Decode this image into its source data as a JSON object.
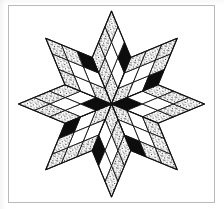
{
  "figure": {
    "kind": "eight-pointed-star-quilt-diagram",
    "border_label": "page-border"
  },
  "style": {
    "line_color": "#111111",
    "paper_color": "#ffffff",
    "solid_fill": "#0d0d0d",
    "stipple_fill": "#1a1a1a",
    "plain_fill": "#ffffff",
    "border_color": "#b9b9b9",
    "stroke_width": 0.9
  },
  "geometry": {
    "center_x": 103.5,
    "center_y": 99.0,
    "arm_length": 93.0,
    "half_width": 19.3,
    "arm_count": 8,
    "grid": 3,
    "arm_angles_deg": [
      270,
      315,
      0,
      45,
      90,
      135,
      180,
      225
    ],
    "arm_names": [
      "arm-north",
      "arm-northeast",
      "arm-east",
      "arm-southeast",
      "arm-south",
      "arm-southwest",
      "arm-west",
      "arm-northwest"
    ]
  },
  "legend": {
    "fills": [
      "solid",
      "stipple",
      "plain"
    ],
    "labels": {
      "solid": "solid black patch",
      "stipple": "stippled / textured patch",
      "plain": "plain white patch"
    }
  },
  "arms": [
    {
      "name": "arm-north",
      "angle": 270,
      "rings": [
        [
          "stipple",
          "plain",
          "solid"
        ],
        [
          "stipple",
          "plain",
          "plain"
        ],
        [
          "stipple",
          "stipple",
          "stipple"
        ]
      ]
    },
    {
      "name": "arm-northeast",
      "angle": 315,
      "rings": [
        [
          "stipple",
          "plain",
          "solid"
        ],
        [
          "plain",
          "plain",
          "stipple"
        ],
        [
          "stipple",
          "stipple",
          "stipple"
        ]
      ]
    },
    {
      "name": "arm-east",
      "angle": 0,
      "rings": [
        [
          "solid",
          "plain",
          "stipple"
        ],
        [
          "plain",
          "plain",
          "stipple"
        ],
        [
          "stipple",
          "stipple",
          "stipple"
        ]
      ]
    },
    {
      "name": "arm-southeast",
      "angle": 45,
      "rings": [
        [
          "stipple",
          "plain",
          "solid"
        ],
        [
          "plain",
          "plain",
          "stipple"
        ],
        [
          "stipple",
          "stipple",
          "stipple"
        ]
      ]
    },
    {
      "name": "arm-south",
      "angle": 90,
      "rings": [
        [
          "stipple",
          "plain",
          "solid"
        ],
        [
          "stipple",
          "plain",
          "plain"
        ],
        [
          "stipple",
          "stipple",
          "stipple"
        ]
      ]
    },
    {
      "name": "arm-southwest",
      "angle": 135,
      "rings": [
        [
          "stipple",
          "plain",
          "solid"
        ],
        [
          "plain",
          "plain",
          "stipple"
        ],
        [
          "stipple",
          "stipple",
          "stipple"
        ]
      ]
    },
    {
      "name": "arm-west",
      "angle": 180,
      "rings": [
        [
          "solid",
          "plain",
          "stipple"
        ],
        [
          "plain",
          "plain",
          "stipple"
        ],
        [
          "stipple",
          "stipple",
          "stipple"
        ]
      ]
    },
    {
      "name": "arm-northwest",
      "angle": 225,
      "rings": [
        [
          "stipple",
          "plain",
          "solid"
        ],
        [
          "plain",
          "plain",
          "stipple"
        ],
        [
          "stipple",
          "stipple",
          "stipple"
        ]
      ]
    }
  ]
}
